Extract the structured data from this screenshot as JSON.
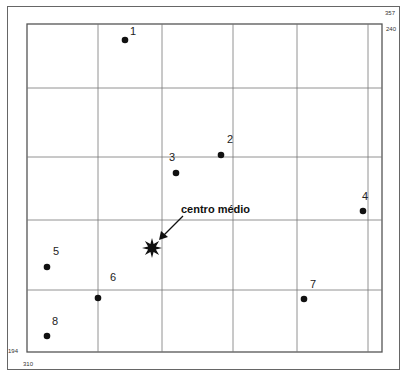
{
  "diagram": {
    "annotation": "centro médio",
    "corner_labels": {
      "top_right_upper": "357",
      "top_right_lower": "240",
      "bottom_left_upper": "194",
      "bottom_left_lower": "310"
    },
    "points": [
      {
        "id": "1",
        "x": 125,
        "y": 40,
        "lx": 130,
        "ly": 26
      },
      {
        "id": "2",
        "x": 221,
        "y": 155,
        "lx": 227,
        "ly": 134
      },
      {
        "id": "3",
        "x": 176,
        "y": 173,
        "lx": 169,
        "ly": 152
      },
      {
        "id": "4",
        "x": 363,
        "y": 211,
        "lx": 362,
        "ly": 191
      },
      {
        "id": "5",
        "x": 47,
        "y": 267,
        "lx": 53,
        "ly": 246
      },
      {
        "id": "6",
        "x": 98,
        "y": 298,
        "lx": 110,
        "ly": 272
      },
      {
        "id": "7",
        "x": 304,
        "y": 299,
        "lx": 310,
        "ly": 279
      },
      {
        "id": "8",
        "x": 47,
        "y": 336,
        "lx": 52,
        "ly": 316
      }
    ],
    "center": {
      "x": 152,
      "y": 248
    },
    "grid": {
      "left": 27,
      "top": 24,
      "right": 382,
      "bottom": 352,
      "vlines": [
        98,
        162,
        233,
        297,
        368
      ],
      "hlines": [
        88,
        157,
        220,
        290
      ]
    },
    "colors": {
      "line": "#555555",
      "grid": "#777777",
      "point": "#111111"
    }
  }
}
